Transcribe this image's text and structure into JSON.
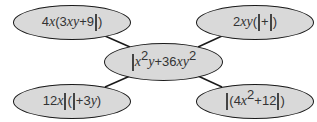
{
  "diagram": {
    "type": "spider-diagram",
    "colors": {
      "node_fill": "#d9d9d9",
      "node_border": "#1a1a1a",
      "text": "#333333",
      "line": "#1a1a1a"
    },
    "center": {
      "expression": "□x²y + 36xy²",
      "parts": {
        "box": "□",
        "x": "x",
        "exp1": "2",
        "y": "y",
        "plus": "+",
        "coef": "36",
        "xy": "xy",
        "exp2": "2"
      }
    },
    "branches": [
      {
        "position": "top-left",
        "expression": "4x(3xy + 9□)",
        "parts": {
          "coef": "4",
          "x": "x",
          "open": "(",
          "coef2": "3",
          "xy": "xy",
          "plus": "+",
          "coef3": "9",
          "close": ")"
        }
      },
      {
        "position": "top-right",
        "expression": "2xy(□ + □)",
        "parts": {
          "coef": "2",
          "xy": "xy",
          "open": "(",
          "plus": "+",
          "close": ")"
        }
      },
      {
        "position": "bottom-left",
        "expression": "12x□(□ + 3y)",
        "parts": {
          "coef": "12",
          "x": "x",
          "open": "(",
          "plus": "+",
          "coef2": "3",
          "y": "y",
          "close": ")"
        }
      },
      {
        "position": "bottom-right",
        "expression": "□(4x² + 12□)",
        "parts": {
          "open": "(",
          "coef": "4",
          "x": "x",
          "exp": "2",
          "plus": "+",
          "coef2": "12",
          "close": ")"
        }
      }
    ]
  }
}
